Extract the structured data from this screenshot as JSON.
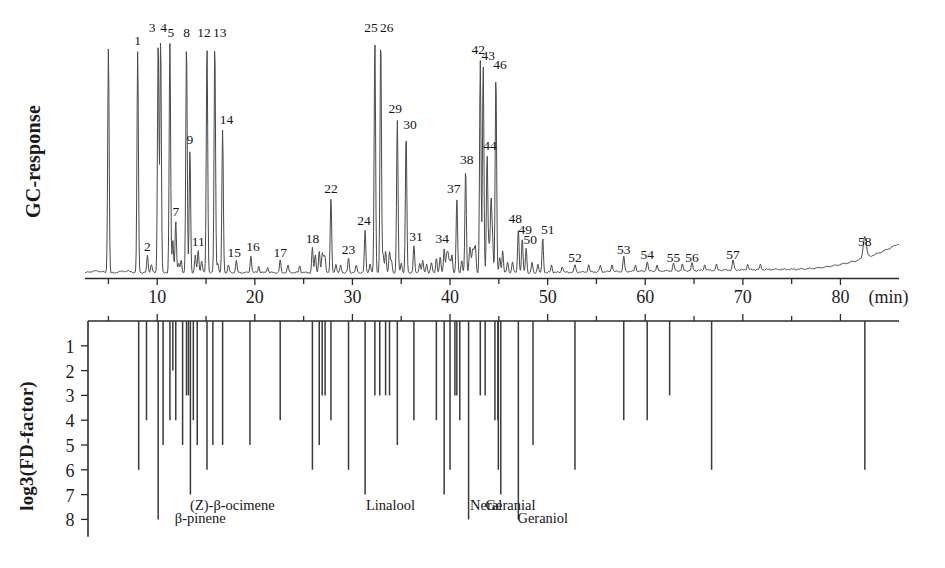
{
  "figure": {
    "type": "aroma-extract-dilution-analysis",
    "top_axis_label": "GC-response",
    "bottom_axis_label": "log3(FD-factor)",
    "x_unit_label": "(min)"
  },
  "chart_data": {
    "type": "line",
    "title": "",
    "xlabel": "(min)",
    "ylabel": "GC-response",
    "xlim": [
      3,
      85
    ],
    "ylim": [
      0,
      1
    ],
    "grid": false,
    "legend": "none",
    "x_ticks": [
      10,
      20,
      30,
      40,
      50,
      60,
      70,
      80
    ],
    "x_tick_labels": [
      "10",
      "20",
      "30",
      "40",
      "50",
      "60",
      "70",
      "80"
    ],
    "x_minor_ticks": [
      5,
      15,
      25,
      35,
      45,
      55,
      65,
      75
    ],
    "peaks": [
      {
        "label": "",
        "rt": 5.0,
        "height": 0.92,
        "width": 0.16
      },
      {
        "label": "1",
        "rt": 8.0,
        "height": 0.9,
        "width": 0.16
      },
      {
        "label": "2",
        "rt": 9.0,
        "height": 0.07,
        "width": 0.16
      },
      {
        "label": "3",
        "rt": 10.1,
        "height": 0.95,
        "width": 0.16
      },
      {
        "label": "4",
        "rt": 10.35,
        "height": 0.95,
        "width": 0.16
      },
      {
        "label": "5",
        "rt": 11.3,
        "height": 0.93,
        "width": 0.16
      },
      {
        "label": "6",
        "rt": 11.6,
        "height": 0.13,
        "width": 0.16
      },
      {
        "label": "7",
        "rt": 11.9,
        "height": 0.21,
        "width": 0.16
      },
      {
        "label": "8",
        "rt": 13.0,
        "height": 0.93,
        "width": 0.16
      },
      {
        "label": "9",
        "rt": 13.35,
        "height": 0.5,
        "width": 0.16
      },
      {
        "label": "10",
        "rt": 13.9,
        "height": 0.07,
        "width": 0.16
      },
      {
        "label": "11",
        "rt": 14.2,
        "height": 0.09,
        "width": 0.16
      },
      {
        "label": "12",
        "rt": 15.1,
        "height": 0.93,
        "width": 0.16
      },
      {
        "label": "13",
        "rt": 15.9,
        "height": 0.93,
        "width": 0.16
      },
      {
        "label": "14",
        "rt": 16.7,
        "height": 0.58,
        "width": 0.16
      },
      {
        "label": "15",
        "rt": 18.1,
        "height": 0.05,
        "width": 0.16
      },
      {
        "label": "16",
        "rt": 19.6,
        "height": 0.07,
        "width": 0.16
      },
      {
        "label": "17",
        "rt": 22.6,
        "height": 0.05,
        "width": 0.16
      },
      {
        "label": "18",
        "rt": 25.9,
        "height": 0.1,
        "width": 0.16
      },
      {
        "label": "19",
        "rt": 26.6,
        "height": 0.09,
        "width": 0.16
      },
      {
        "label": "20",
        "rt": 26.9,
        "height": 0.07,
        "width": 0.16
      },
      {
        "label": "21",
        "rt": 27.2,
        "height": 0.06,
        "width": 0.16
      },
      {
        "label": "22",
        "rt": 27.8,
        "height": 0.3,
        "width": 0.16
      },
      {
        "label": "23",
        "rt": 29.6,
        "height": 0.06,
        "width": 0.16
      },
      {
        "label": "24",
        "rt": 31.3,
        "height": 0.17,
        "width": 0.16
      },
      {
        "label": "25",
        "rt": 32.3,
        "height": 0.95,
        "width": 0.16
      },
      {
        "label": "26",
        "rt": 32.9,
        "height": 0.95,
        "width": 0.16
      },
      {
        "label": "27",
        "rt": 33.4,
        "height": 0.09,
        "width": 0.16
      },
      {
        "label": "28",
        "rt": 33.8,
        "height": 0.08,
        "width": 0.16
      },
      {
        "label": "29",
        "rt": 34.6,
        "height": 0.62,
        "width": 0.16
      },
      {
        "label": "30",
        "rt": 35.5,
        "height": 0.56,
        "width": 0.16
      },
      {
        "label": "31",
        "rt": 36.3,
        "height": 0.11,
        "width": 0.16
      },
      {
        "label": "32",
        "rt": 37.2,
        "height": 0.05,
        "width": 0.16
      },
      {
        "label": "33",
        "rt": 38.6,
        "height": 0.06,
        "width": 0.16
      },
      {
        "label": "34",
        "rt": 39.4,
        "height": 0.1,
        "width": 0.16
      },
      {
        "label": "35",
        "rt": 39.8,
        "height": 0.07,
        "width": 0.16
      },
      {
        "label": "36",
        "rt": 40.2,
        "height": 0.07,
        "width": 0.16
      },
      {
        "label": "37",
        "rt": 40.7,
        "height": 0.3,
        "width": 0.16
      },
      {
        "label": "38",
        "rt": 41.6,
        "height": 0.42,
        "width": 0.16
      },
      {
        "label": "39",
        "rt": 42.0,
        "height": 0.07,
        "width": 0.16
      },
      {
        "label": "40",
        "rt": 42.3,
        "height": 0.08,
        "width": 0.16
      },
      {
        "label": "41",
        "rt": 42.6,
        "height": 0.1,
        "width": 0.16
      },
      {
        "label": "42",
        "rt": 43.1,
        "height": 0.86,
        "width": 0.16
      },
      {
        "label": "43",
        "rt": 43.4,
        "height": 0.84,
        "width": 0.16
      },
      {
        "label": "44",
        "rt": 43.8,
        "height": 0.48,
        "width": 0.16
      },
      {
        "label": "45",
        "rt": 44.2,
        "height": 0.28,
        "width": 0.16
      },
      {
        "label": "46",
        "rt": 44.7,
        "height": 0.8,
        "width": 0.16
      },
      {
        "label": "47",
        "rt": 45.4,
        "height": 0.09,
        "width": 0.16
      },
      {
        "label": "48",
        "rt": 47.0,
        "height": 0.18,
        "width": 0.16
      },
      {
        "label": "49",
        "rt": 47.4,
        "height": 0.14,
        "width": 0.16
      },
      {
        "label": "50",
        "rt": 47.8,
        "height": 0.1,
        "width": 0.16
      },
      {
        "label": "51",
        "rt": 49.5,
        "height": 0.14,
        "width": 0.16
      },
      {
        "label": "52",
        "rt": 52.8,
        "height": 0.03,
        "width": 0.18
      },
      {
        "label": "53",
        "rt": 57.8,
        "height": 0.06,
        "width": 0.18
      },
      {
        "label": "54",
        "rt": 60.2,
        "height": 0.04,
        "width": 0.18
      },
      {
        "label": "55",
        "rt": 62.9,
        "height": 0.03,
        "width": 0.18
      },
      {
        "label": "56",
        "rt": 64.8,
        "height": 0.03,
        "width": 0.18
      },
      {
        "label": "57",
        "rt": 69.0,
        "height": 0.04,
        "width": 0.18
      },
      {
        "label": "58",
        "rt": 82.5,
        "height": 0.09,
        "width": 0.35
      }
    ]
  },
  "fd_chart": {
    "type": "bar",
    "ylabel": "log3(FD-factor)",
    "y_ticks": [
      1,
      2,
      3,
      4,
      5,
      6,
      7,
      8
    ],
    "y_tick_labels": [
      "1",
      "2",
      "3",
      "4",
      "5",
      "6",
      "7",
      "8"
    ],
    "ylim": [
      0,
      8.6
    ],
    "direction": "down",
    "xlim": [
      3,
      85
    ],
    "bars": [
      {
        "rt": 8.1,
        "fd": 6
      },
      {
        "rt": 8.9,
        "fd": 4
      },
      {
        "rt": 10.1,
        "fd": 8
      },
      {
        "rt": 10.6,
        "fd": 5
      },
      {
        "rt": 11.3,
        "fd": 4
      },
      {
        "rt": 11.6,
        "fd": 2
      },
      {
        "rt": 11.9,
        "fd": 4
      },
      {
        "rt": 12.6,
        "fd": 5
      },
      {
        "rt": 13.0,
        "fd": 3
      },
      {
        "rt": 13.2,
        "fd": 3
      },
      {
        "rt": 13.4,
        "fd": 7
      },
      {
        "rt": 13.7,
        "fd": 4
      },
      {
        "rt": 14.1,
        "fd": 5
      },
      {
        "rt": 15.1,
        "fd": 6
      },
      {
        "rt": 15.7,
        "fd": 5
      },
      {
        "rt": 16.7,
        "fd": 5
      },
      {
        "rt": 19.5,
        "fd": 5
      },
      {
        "rt": 22.6,
        "fd": 4
      },
      {
        "rt": 25.9,
        "fd": 6
      },
      {
        "rt": 26.6,
        "fd": 5
      },
      {
        "rt": 26.9,
        "fd": 3
      },
      {
        "rt": 27.2,
        "fd": 3
      },
      {
        "rt": 27.8,
        "fd": 4
      },
      {
        "rt": 29.6,
        "fd": 6
      },
      {
        "rt": 31.3,
        "fd": 7
      },
      {
        "rt": 32.3,
        "fd": 3
      },
      {
        "rt": 32.8,
        "fd": 3
      },
      {
        "rt": 33.4,
        "fd": 3
      },
      {
        "rt": 33.8,
        "fd": 3
      },
      {
        "rt": 34.6,
        "fd": 5
      },
      {
        "rt": 36.3,
        "fd": 4
      },
      {
        "rt": 38.6,
        "fd": 4
      },
      {
        "rt": 39.4,
        "fd": 7
      },
      {
        "rt": 40.0,
        "fd": 6
      },
      {
        "rt": 40.5,
        "fd": 3
      },
      {
        "rt": 40.7,
        "fd": 3
      },
      {
        "rt": 41.0,
        "fd": 4
      },
      {
        "rt": 41.9,
        "fd": 8
      },
      {
        "rt": 43.1,
        "fd": 3
      },
      {
        "rt": 43.6,
        "fd": 3
      },
      {
        "rt": 44.6,
        "fd": 4
      },
      {
        "rt": 44.9,
        "fd": 4
      },
      {
        "rt": 44.95,
        "fd": 6
      },
      {
        "rt": 45.2,
        "fd": 7
      },
      {
        "rt": 47.0,
        "fd": 8
      },
      {
        "rt": 48.5,
        "fd": 5
      },
      {
        "rt": 52.8,
        "fd": 6
      },
      {
        "rt": 57.8,
        "fd": 4
      },
      {
        "rt": 60.2,
        "fd": 4
      },
      {
        "rt": 62.5,
        "fd": 3
      },
      {
        "rt": 66.8,
        "fd": 6
      },
      {
        "rt": 82.5,
        "fd": 6
      }
    ],
    "annotations": [
      {
        "text": "β-pinene",
        "rt": 10.1,
        "row": 2
      },
      {
        "text": "(Z)-β-ocimene",
        "rt": 13.4,
        "row": 1
      },
      {
        "text": "Linalool",
        "rt": 29.6,
        "row": 1
      },
      {
        "text": "Neral",
        "rt": 39.4,
        "row": 1
      },
      {
        "text": "Geranial",
        "rt": 41.9,
        "row": 1
      },
      {
        "text": "Geraniol",
        "rt": 45.2,
        "row": 2
      }
    ]
  }
}
